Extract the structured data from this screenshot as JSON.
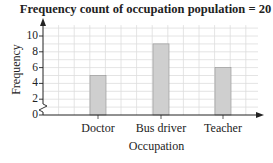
{
  "chart_data": {
    "type": "bar",
    "title": "Frequency count of occupation population = 20",
    "xlabel": "Occupation",
    "ylabel": "Frequency",
    "categories": [
      "Doctor",
      "Bus driver",
      "Teacher"
    ],
    "values": [
      5,
      9,
      6
    ],
    "ylim": [
      0,
      11
    ],
    "yticks": [
      "0",
      "2",
      "4",
      "6",
      "8",
      "10"
    ],
    "grid": true,
    "axis_break": true,
    "bar_color": "#cfcfcf",
    "bar_edge_color": "#9a9a9a",
    "grid_color": "#dddddd"
  }
}
